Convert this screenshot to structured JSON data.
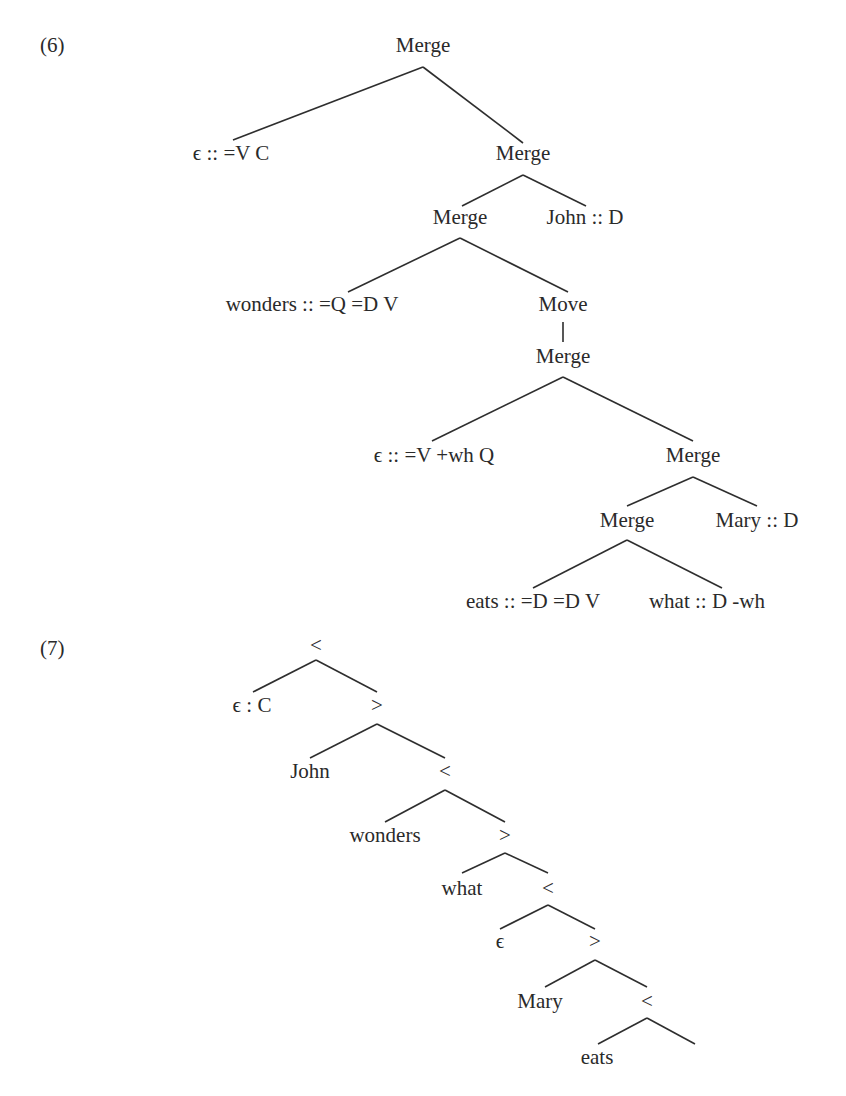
{
  "examples": [
    {
      "number": "(6)",
      "number_pos": [
        40,
        52
      ],
      "title": "Derivation tree",
      "nodes": [
        {
          "id": "n1",
          "label": "Merge",
          "x": 423,
          "y": 52
        },
        {
          "id": "n2",
          "label": "ϵ :: =V C",
          "x": 231,
          "y": 160
        },
        {
          "id": "n3",
          "label": "Merge",
          "x": 523,
          "y": 160
        },
        {
          "id": "n4",
          "label": "Merge",
          "x": 460,
          "y": 224
        },
        {
          "id": "n5",
          "label": "John :: D",
          "x": 585,
          "y": 224
        },
        {
          "id": "n6",
          "label": "wonders :: =Q =D V",
          "x": 312,
          "y": 311
        },
        {
          "id": "n7",
          "label": "Move",
          "x": 563,
          "y": 311
        },
        {
          "id": "n8",
          "label": "Merge",
          "x": 563,
          "y": 363
        },
        {
          "id": "n9",
          "label": "ϵ :: =V +wh Q",
          "x": 434,
          "y": 462
        },
        {
          "id": "n10",
          "label": "Merge",
          "x": 693,
          "y": 462
        },
        {
          "id": "n11",
          "label": "Merge",
          "x": 627,
          "y": 527
        },
        {
          "id": "n12",
          "label": "Mary :: D",
          "x": 757,
          "y": 527
        },
        {
          "id": "n13",
          "label": "eats :: =D =D V",
          "x": 533,
          "y": 608
        },
        {
          "id": "n14",
          "label": "what :: D -wh",
          "x": 707,
          "y": 608
        }
      ],
      "edges": [
        [
          423,
          67,
          233,
          140
        ],
        [
          423,
          67,
          523,
          143
        ],
        [
          523,
          175,
          462,
          206
        ],
        [
          523,
          175,
          586,
          206
        ],
        [
          460,
          238,
          348,
          292
        ],
        [
          460,
          238,
          568,
          292
        ],
        [
          563,
          322,
          563,
          342
        ],
        [
          563,
          377,
          432,
          441
        ],
        [
          563,
          377,
          693,
          441
        ],
        [
          693,
          477,
          627,
          506
        ],
        [
          693,
          477,
          757,
          506
        ],
        [
          627,
          540,
          533,
          588
        ],
        [
          627,
          540,
          722,
          588
        ]
      ]
    },
    {
      "number": "(7)",
      "number_pos": [
        40,
        655
      ],
      "title": "Derived tree",
      "nodes": [
        {
          "id": "m1",
          "label": "<",
          "x": 316,
          "y": 652
        },
        {
          "id": "m2",
          "label": "ϵ : C",
          "x": 252,
          "y": 712
        },
        {
          "id": "m3",
          "label": ">",
          "x": 377,
          "y": 712
        },
        {
          "id": "m4",
          "label": "John",
          "x": 310,
          "y": 778
        },
        {
          "id": "m5",
          "label": "<",
          "x": 445,
          "y": 778
        },
        {
          "id": "m6",
          "label": "wonders",
          "x": 385,
          "y": 842
        },
        {
          "id": "m7",
          "label": ">",
          "x": 505,
          "y": 842
        },
        {
          "id": "m8",
          "label": "what",
          "x": 462,
          "y": 895
        },
        {
          "id": "m9",
          "label": "<",
          "x": 548,
          "y": 895
        },
        {
          "id": "m10",
          "label": "ϵ",
          "x": 500,
          "y": 948
        },
        {
          "id": "m11",
          "label": ">",
          "x": 595,
          "y": 948
        },
        {
          "id": "m12",
          "label": "Mary",
          "x": 540,
          "y": 1008
        },
        {
          "id": "m13",
          "label": "<",
          "x": 647,
          "y": 1008
        },
        {
          "id": "m14",
          "label": "eats",
          "x": 597,
          "y": 1064
        }
      ],
      "edges": [
        [
          316,
          660,
          253,
          692
        ],
        [
          316,
          660,
          377,
          692
        ],
        [
          377,
          724,
          310,
          758
        ],
        [
          377,
          724,
          445,
          758
        ],
        [
          445,
          790,
          385,
          822
        ],
        [
          445,
          790,
          505,
          822
        ],
        [
          505,
          853,
          462,
          873
        ],
        [
          505,
          853,
          548,
          873
        ],
        [
          548,
          905,
          500,
          929
        ],
        [
          548,
          905,
          595,
          929
        ],
        [
          595,
          960,
          545,
          987
        ],
        [
          595,
          960,
          647,
          987
        ],
        [
          647,
          1018,
          598,
          1044
        ],
        [
          647,
          1018,
          695,
          1044
        ]
      ]
    }
  ]
}
